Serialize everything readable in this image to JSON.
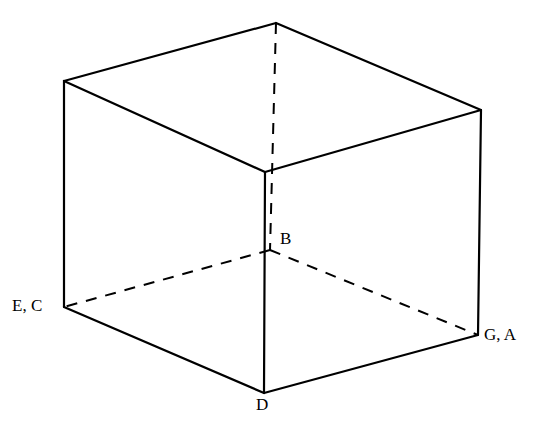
{
  "figure": {
    "background_color": "#ffffff",
    "stroke_color": "#000000",
    "width": 541,
    "height": 431
  },
  "labels": {
    "left": "E, C",
    "right": "G, A",
    "center": "B",
    "bottom": "D"
  },
  "chart_data": {
    "type": "diagram",
    "subtype": "cube-wireframe-projection",
    "xlabel": "",
    "ylabel": "",
    "grid": false,
    "legend": "none",
    "stroke_color": "#000000",
    "background_color": "#ffffff",
    "solid_stroke_width": 2.2,
    "dashed_stroke_width": 2.0,
    "dash_pattern": "11 9",
    "points": {
      "top_apex": [
        276,
        23
      ],
      "top_left": [
        64,
        81
      ],
      "top_right": [
        481,
        110
      ],
      "front_center_top": [
        265,
        172
      ],
      "back_center_bottom": [
        270,
        250
      ],
      "left_bottom": [
        64,
        307
      ],
      "right_bottom": [
        478,
        335
      ],
      "front_bottom": [
        264,
        393
      ]
    },
    "labeled_vertices": [
      {
        "id": "EC",
        "text": "E, C",
        "point": [
          64,
          307
        ],
        "label_xy": [
          12,
          297
        ],
        "anchor": "right"
      },
      {
        "id": "GA",
        "text": "G, A",
        "point": [
          478,
          335
        ],
        "label_xy": [
          484,
          326
        ],
        "anchor": "left"
      },
      {
        "id": "B",
        "text": "B",
        "point": [
          270,
          250
        ],
        "label_xy": [
          280,
          230
        ],
        "anchor": "left"
      },
      {
        "id": "D",
        "text": "D",
        "point": [
          264,
          393
        ],
        "label_xy": [
          256,
          396
        ],
        "anchor": "center"
      }
    ],
    "solid_edges": [
      {
        "name": "top-left-to-apex",
        "from": [
          64,
          81
        ],
        "to": [
          276,
          23
        ]
      },
      {
        "name": "apex-to-top-right",
        "from": [
          276,
          23
        ],
        "to": [
          481,
          110
        ]
      },
      {
        "name": "top-left-to-front-center",
        "from": [
          64,
          81
        ],
        "to": [
          265,
          172
        ]
      },
      {
        "name": "front-center-to-top-right",
        "from": [
          265,
          172
        ],
        "to": [
          481,
          110
        ]
      },
      {
        "name": "left-vertical",
        "from": [
          64,
          81
        ],
        "to": [
          64,
          307
        ]
      },
      {
        "name": "right-vertical",
        "from": [
          481,
          110
        ],
        "to": [
          478,
          335
        ]
      },
      {
        "name": "front-vertical",
        "from": [
          265,
          172
        ],
        "to": [
          264,
          393
        ]
      },
      {
        "name": "left-bottom-to-front-bottom",
        "from": [
          64,
          307
        ],
        "to": [
          264,
          393
        ]
      },
      {
        "name": "front-bottom-to-right-bottom",
        "from": [
          264,
          393
        ],
        "to": [
          478,
          335
        ]
      }
    ],
    "dashed_edges": [
      {
        "name": "hidden-back-vertical",
        "from": [
          276,
          23
        ],
        "to": [
          270,
          250
        ]
      },
      {
        "name": "hidden-back-left",
        "from": [
          270,
          250
        ],
        "to": [
          64,
          307
        ]
      },
      {
        "name": "hidden-back-right",
        "from": [
          270,
          250
        ],
        "to": [
          478,
          335
        ]
      }
    ]
  }
}
